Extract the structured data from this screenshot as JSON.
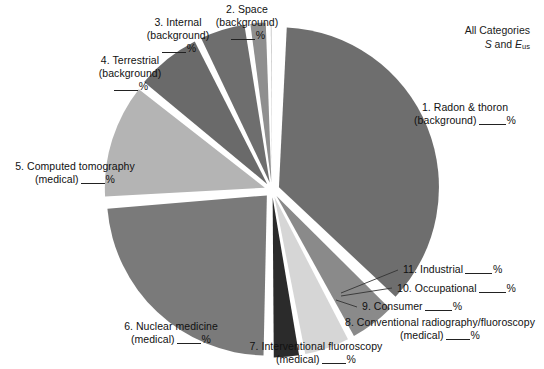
{
  "figure": {
    "type": "exploded-pie-chart",
    "title_line1": "All Categories",
    "title_symbol_s": "S",
    "title_conj": "and",
    "title_symbol_e": "E",
    "title_symbol_e_sub": "us",
    "percent_sign": "%",
    "value_placeholder": "____"
  },
  "labels": {
    "radon": {
      "line1": "1. Radon & thoron",
      "line2": "(background)"
    },
    "space": {
      "line1": "2. Space",
      "line2": "(background)"
    },
    "internal": {
      "line1": "3. Internal",
      "line2": "(background)"
    },
    "terrestrial": {
      "line1": "4. Terrestrial",
      "line2": "(background)"
    },
    "ct": {
      "line1": "5. Computed tomography",
      "line2": "(medical)"
    },
    "nuclear": {
      "line1": "6. Nuclear medicine",
      "line2": "(medical)"
    },
    "interventional": {
      "line1": "7. Interventional fluoroscopy",
      "line2": "(medical)"
    },
    "conventional": {
      "line1": "8. Conventional radiography/fluoroscopy",
      "line2": "(medical)"
    },
    "consumer": {
      "line1": "9. Consumer"
    },
    "occupational": {
      "line1": "10. Occupational"
    },
    "industrial": {
      "line1": "11. Industrial"
    }
  },
  "chart_data": {
    "type": "pie",
    "exploded": true,
    "values_hidden": true,
    "value_placeholder": "____%",
    "note": "All percentage values are printed as blank fill-in rules (worksheet figure); slice sizes estimated from rendered wedge angles.",
    "categories": [
      "1. Radon & thoron (background)",
      "2. Space (background)",
      "3. Internal (background)",
      "4. Terrestrial (background)",
      "5. Computed tomography (medical)",
      "6. Nuclear medicine (medical)",
      "7. Interventional fluoroscopy (medical)",
      "8. Conventional radiography/fluoroscopy (medical)",
      "9. Consumer",
      "10. Occupational",
      "11. Industrial"
    ],
    "values": [
      37,
      5,
      5,
      3,
      24,
      12,
      7,
      5,
      2,
      0.5,
      0.4
    ],
    "colors": [
      "#6e6e6e",
      "#8a8a8a",
      "#d6d6d6",
      "#2b2b2b",
      "#7a7a7a",
      "#b4b4b4",
      "#6a6a6a",
      "#6e6e6e",
      "#8f8f8f",
      "#9a9a9a",
      "#707070"
    ],
    "legend": "none",
    "grid": false,
    "labels_position": "outside-with-leader-lines"
  }
}
